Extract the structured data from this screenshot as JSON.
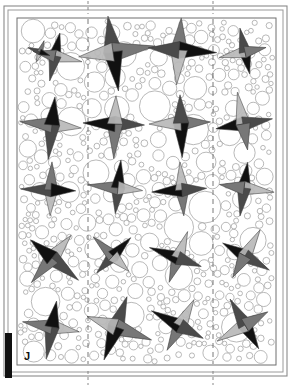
{
  "figure": {
    "panel_label": "J",
    "type": "circle-packing-with-pinwheel-markers",
    "background_color": "#ffffff",
    "caption_text": ""
  },
  "frame": {
    "name": "double-line-border",
    "outer": {
      "x": 4,
      "y": 6,
      "width": 283,
      "height": 370,
      "stroke": "#8a8a8a",
      "stroke_width": 1.1
    },
    "inner": {
      "x": 8,
      "y": 10,
      "width": 275,
      "height": 362,
      "stroke": "#9a9a9a",
      "stroke_width": 1.0
    },
    "plot": {
      "x": 17,
      "y": 18,
      "width": 259,
      "height": 347,
      "stroke": "#6f6f6f",
      "stroke_width": 1.0
    }
  },
  "scale_bar": {
    "name": "scale-bar",
    "x": 5,
    "y": 333,
    "width": 7,
    "height": 45,
    "color": "#101010",
    "label": ""
  },
  "section_lines": [
    {
      "name": "section-line-left",
      "x": 88,
      "dash": "5,4",
      "stroke": "#6a6a6a",
      "stroke_width": 0.9
    },
    {
      "name": "section-line-right",
      "x": 213,
      "dash": "5,4",
      "stroke": "#6a6a6a",
      "stroke_width": 0.9
    }
  ],
  "tick_marks": [
    {
      "name": "tick-top-left",
      "x": 88,
      "y1": 1,
      "y2": 14
    },
    {
      "name": "tick-top-right",
      "x": 213,
      "y1": 1,
      "y2": 14
    },
    {
      "name": "tick-bottom-left",
      "x": 88,
      "y1": 371,
      "y2": 385
    },
    {
      "name": "tick-bottom-right",
      "x": 213,
      "y1": 371,
      "y2": 385
    }
  ],
  "markers": {
    "name": "pinwheel-star-grid",
    "rows": 5,
    "cols": 4,
    "count": 20,
    "shape": "four-pointed-star",
    "fill_colors": {
      "black": "#111111",
      "dark_gray": "#4a4a4a",
      "mid_gray": "#777777",
      "light_gray": "#b9b9b9",
      "outline": "#3a3a3a"
    },
    "items": [
      {
        "id": "m-r1c1",
        "cx": 55,
        "cy": 56,
        "size": 24,
        "rot": 12,
        "scale": 0.85
      },
      {
        "id": "m-r1c1b",
        "cx": 40,
        "cy": 52,
        "size": 16,
        "rot": 200,
        "scale": 0.6
      },
      {
        "id": "m-r1c2",
        "cx": 113,
        "cy": 52,
        "size": 30,
        "rot": -8,
        "scale": 1.05
      },
      {
        "id": "m-r1c3",
        "cx": 179,
        "cy": 50,
        "size": 28,
        "rot": 4,
        "scale": 1.0
      },
      {
        "id": "m-r1c4",
        "cx": 245,
        "cy": 52,
        "size": 23,
        "rot": 168,
        "scale": 0.85
      },
      {
        "id": "m-r2c1",
        "cx": 52,
        "cy": 125,
        "size": 27,
        "rot": 96,
        "scale": 0.95
      },
      {
        "id": "m-r2c2",
        "cx": 115,
        "cy": 124,
        "size": 27,
        "rot": 92,
        "scale": 0.95
      },
      {
        "id": "m-r2c3",
        "cx": 181,
        "cy": 123,
        "size": 27,
        "rot": 88,
        "scale": 0.95
      },
      {
        "id": "m-r2c4",
        "cx": 243,
        "cy": 124,
        "size": 26,
        "rot": 260,
        "scale": 0.92
      },
      {
        "id": "m-r3c1",
        "cx": 51,
        "cy": 190,
        "size": 25,
        "rot": 182,
        "scale": 0.9
      },
      {
        "id": "m-r3c2",
        "cx": 118,
        "cy": 188,
        "size": 25,
        "rot": 186,
        "scale": 0.9
      },
      {
        "id": "m-r3c3",
        "cx": 182,
        "cy": 190,
        "size": 25,
        "rot": 176,
        "scale": 0.9
      },
      {
        "id": "m-r3c4",
        "cx": 244,
        "cy": 188,
        "size": 25,
        "rot": 8,
        "scale": 0.9
      },
      {
        "id": "m-r4c1",
        "cx": 52,
        "cy": 258,
        "size": 27,
        "rot": 40,
        "scale": 0.95
      },
      {
        "id": "m-r4c2",
        "cx": 113,
        "cy": 256,
        "size": 24,
        "rot": 224,
        "scale": 0.85
      },
      {
        "id": "m-r4c3",
        "cx": 178,
        "cy": 258,
        "size": 25,
        "rot": 200,
        "scale": 0.9
      },
      {
        "id": "m-r4c4",
        "cx": 245,
        "cy": 256,
        "size": 25,
        "rot": 300,
        "scale": 0.9
      },
      {
        "id": "m-r5c1",
        "cx": 52,
        "cy": 327,
        "size": 26,
        "rot": 100,
        "scale": 0.92
      },
      {
        "id": "m-r5c2",
        "cx": 116,
        "cy": 327,
        "size": 28,
        "rot": 20,
        "scale": 1.0
      },
      {
        "id": "m-r5c3",
        "cx": 180,
        "cy": 326,
        "size": 26,
        "rot": 208,
        "scale": 0.92
      },
      {
        "id": "m-r5c4",
        "cx": 245,
        "cy": 325,
        "size": 26,
        "rot": 150,
        "scale": 0.92
      }
    ]
  },
  "circle_packing": {
    "name": "packed-circles",
    "fill": "#ffffff",
    "stroke": "#9b9b9b",
    "stroke_width": 0.7,
    "region": {
      "x": 18,
      "y": 19,
      "width": 257,
      "height": 345
    },
    "radius_range": [
      2.2,
      17.0
    ],
    "approx_count": 470
  }
}
